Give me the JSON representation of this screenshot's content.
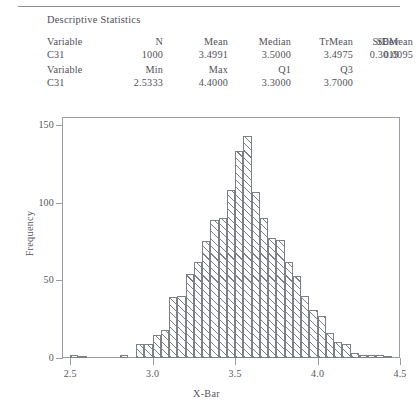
{
  "page": {
    "cropped_running_head": "",
    "section_title": "Descriptive Statistics"
  },
  "stats": {
    "table1": {
      "headers": [
        "Variable",
        "N",
        "Mean",
        "Median",
        "TrMean",
        "StDev",
        "SEMean"
      ],
      "row": [
        "C31",
        "1000",
        "3.4991",
        "3.5000",
        "3.4975",
        "0.3019",
        "0.0095"
      ]
    },
    "table2": {
      "headers": [
        "Variable",
        "Min",
        "Max",
        "Q1",
        "Q3"
      ],
      "row": [
        "C31",
        "2.5333",
        "4.4000",
        "3.3000",
        "3.7000"
      ]
    }
  },
  "chart_data": {
    "type": "bar",
    "title": "",
    "xlabel": "X-Bar",
    "ylabel": "Frequency",
    "xlim": [
      2.45,
      4.5
    ],
    "ylim": [
      0,
      155
    ],
    "xticks": [
      2.5,
      3.0,
      3.5,
      4.0,
      4.5
    ],
    "xtick_labels": [
      "2.5",
      "3.0",
      "3.5",
      "4.0",
      "4.5"
    ],
    "yticks": [
      0,
      50,
      100,
      150
    ],
    "ytick_labels": [
      "0",
      "50",
      "100",
      "150"
    ],
    "grid": false,
    "legend": null,
    "bin_width": 0.05,
    "bin_starts": [
      2.5,
      2.55,
      2.6,
      2.65,
      2.7,
      2.75,
      2.8,
      2.85,
      2.9,
      2.95,
      3.0,
      3.05,
      3.1,
      3.15,
      3.2,
      3.25,
      3.3,
      3.35,
      3.4,
      3.45,
      3.5,
      3.55,
      3.6,
      3.65,
      3.7,
      3.75,
      3.8,
      3.85,
      3.9,
      3.95,
      4.0,
      4.05,
      4.1,
      4.15,
      4.2,
      4.25,
      4.3,
      4.35,
      4.4
    ],
    "categories": [
      "2.50",
      "2.55",
      "2.60",
      "2.65",
      "2.70",
      "2.75",
      "2.80",
      "2.85",
      "2.90",
      "2.95",
      "3.00",
      "3.05",
      "3.10",
      "3.15",
      "3.20",
      "3.25",
      "3.30",
      "3.35",
      "3.40",
      "3.45",
      "3.50",
      "3.55",
      "3.60",
      "3.65",
      "3.70",
      "3.75",
      "3.80",
      "3.85",
      "3.90",
      "3.95",
      "4.00",
      "4.05",
      "4.10",
      "4.15",
      "4.20",
      "4.25",
      "4.30",
      "4.35",
      "4.40"
    ],
    "values": [
      2,
      1,
      0,
      0,
      0,
      0,
      2,
      0,
      9,
      9,
      15,
      18,
      39,
      40,
      54,
      62,
      75,
      89,
      90,
      108,
      133,
      143,
      107,
      90,
      77,
      76,
      62,
      53,
      40,
      31,
      27,
      16,
      10,
      9,
      3,
      2,
      2,
      2,
      1
    ]
  }
}
